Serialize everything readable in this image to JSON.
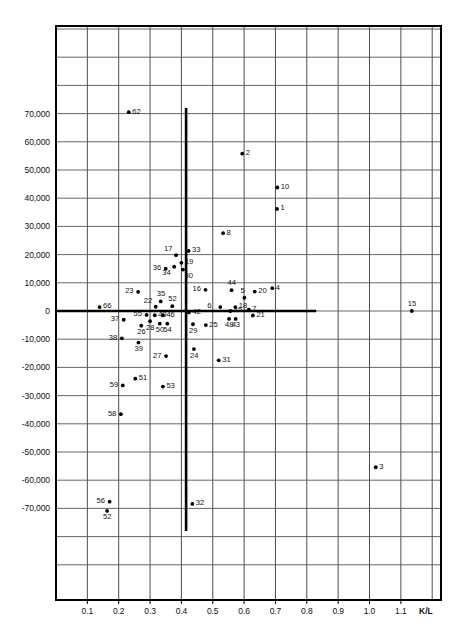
{
  "chart_data": {
    "type": "scatter",
    "title": "",
    "xlabel": "K/L",
    "ylabel": "",
    "xlim": [
      0.0,
      1.2
    ],
    "ylim": [
      -90000,
      100000
    ],
    "grid": true,
    "legend": false,
    "xticks": [
      {
        "value": 0.1,
        "label": "0.1"
      },
      {
        "value": 0.2,
        "label": "0.2"
      },
      {
        "value": 0.3,
        "label": "0.3"
      },
      {
        "value": 0.4,
        "label": "0.4"
      },
      {
        "value": 0.5,
        "label": "0.5"
      },
      {
        "value": 0.6,
        "label": "0.6"
      },
      {
        "value": 0.7,
        "label": "0.7"
      },
      {
        "value": 0.8,
        "label": "0.8"
      },
      {
        "value": 0.9,
        "label": "0.9"
      },
      {
        "value": 1.0,
        "label": "1.0"
      },
      {
        "value": 1.1,
        "label": "1.1"
      }
    ],
    "yticks": [
      {
        "value": 70000,
        "label": "70,000"
      },
      {
        "value": 60000,
        "label": "60,000"
      },
      {
        "value": 50000,
        "label": "50,000"
      },
      {
        "value": 40000,
        "label": "40,000"
      },
      {
        "value": 30000,
        "label": "30,000"
      },
      {
        "value": 20000,
        "label": "20,000"
      },
      {
        "value": 10000,
        "label": "10,000"
      },
      {
        "value": 0,
        "label": "0"
      },
      {
        "value": -10000,
        "label": "-10,000"
      },
      {
        "value": -20000,
        "label": "-20,000"
      },
      {
        "value": -30000,
        "label": "-30,000"
      },
      {
        "value": -40000,
        "label": "-40,000"
      },
      {
        "value": -50000,
        "label": "-50,000"
      },
      {
        "value": -60000,
        "label": "-60,000"
      },
      {
        "value": -70000,
        "label": "-70,000"
      }
    ],
    "reference_lines": {
      "vertical": {
        "x": 0.415,
        "y_from": -78000,
        "y_to": 72000,
        "color": "#000000"
      },
      "horizontal": {
        "y": 0,
        "x_from": 0.0,
        "x_to": 0.83,
        "color": "#000000"
      }
    },
    "points": [
      {
        "id": "62",
        "x": 0.232,
        "y": 70500,
        "label_side": "right"
      },
      {
        "id": "2",
        "x": 0.594,
        "y": 55800,
        "label_side": "right"
      },
      {
        "id": "10",
        "x": 0.706,
        "y": 43800,
        "label_side": "right"
      },
      {
        "id": "1",
        "x": 0.705,
        "y": 36200,
        "label_side": "right"
      },
      {
        "id": "8",
        "x": 0.533,
        "y": 27600,
        "label_side": "right"
      },
      {
        "id": "33",
        "x": 0.423,
        "y": 21300,
        "label_side": "right"
      },
      {
        "id": "17",
        "x": 0.383,
        "y": 19800,
        "label_side": "above-left"
      },
      {
        "id": "19",
        "x": 0.4,
        "y": 17100,
        "label_side": "right"
      },
      {
        "id": "36",
        "x": 0.35,
        "y": 15000,
        "label_side": "left"
      },
      {
        "id": "34",
        "x": 0.377,
        "y": 15700,
        "label_side": "below-left"
      },
      {
        "id": "30",
        "x": 0.405,
        "y": 14700,
        "label_side": "below-right"
      },
      {
        "id": "23",
        "x": 0.262,
        "y": 6800,
        "label_side": "left"
      },
      {
        "id": "35",
        "x": 0.334,
        "y": 3400,
        "label_side": "above"
      },
      {
        "id": "16",
        "x": 0.477,
        "y": 7500,
        "label_side": "left"
      },
      {
        "id": "44",
        "x": 0.56,
        "y": 7400,
        "label_side": "above"
      },
      {
        "id": "5",
        "x": 0.601,
        "y": 4700,
        "label_side": "above"
      },
      {
        "id": "20",
        "x": 0.634,
        "y": 6900,
        "label_side": "right"
      },
      {
        "id": "4",
        "x": 0.69,
        "y": 8100,
        "label_side": "right"
      },
      {
        "id": "66",
        "x": 0.139,
        "y": 1400,
        "label_side": "right"
      },
      {
        "id": "22",
        "x": 0.318,
        "y": 1500,
        "label_side": "above-left"
      },
      {
        "id": "52",
        "x": 0.371,
        "y": 1700,
        "label_side": "above"
      },
      {
        "id": "6",
        "x": 0.524,
        "y": 1400,
        "label_side": "left"
      },
      {
        "id": "18",
        "x": 0.572,
        "y": 1400,
        "label_side": "right"
      },
      {
        "id": "45",
        "x": 0.556,
        "y": 0,
        "label_side": "right"
      },
      {
        "id": "7",
        "x": 0.615,
        "y": 500,
        "label_side": "right"
      },
      {
        "id": "15",
        "x": 1.135,
        "y": 0,
        "label_side": "above"
      },
      {
        "id": "42",
        "x": 0.424,
        "y": -500,
        "label_side": "right"
      },
      {
        "id": "55",
        "x": 0.289,
        "y": -1400,
        "label_side": "left"
      },
      {
        "id": "49",
        "x": 0.315,
        "y": -1500,
        "label_side": "right"
      },
      {
        "id": "46",
        "x": 0.341,
        "y": -1500,
        "label_side": "right"
      },
      {
        "id": "21",
        "x": 0.628,
        "y": -1600,
        "label_side": "right"
      },
      {
        "id": "43",
        "x": 0.573,
        "y": -2800,
        "label_side": "below"
      },
      {
        "id": "48",
        "x": 0.552,
        "y": -2800,
        "label_side": "below"
      },
      {
        "id": "37",
        "x": 0.216,
        "y": -3100,
        "label_side": "left"
      },
      {
        "id": "28",
        "x": 0.3,
        "y": -3600,
        "label_side": "below"
      },
      {
        "id": "50",
        "x": 0.331,
        "y": -4500,
        "label_side": "below"
      },
      {
        "id": "54",
        "x": 0.355,
        "y": -4500,
        "label_side": "below"
      },
      {
        "id": "29",
        "x": 0.437,
        "y": -4700,
        "label_side": "below"
      },
      {
        "id": "25",
        "x": 0.478,
        "y": -5000,
        "label_side": "right"
      },
      {
        "id": "26",
        "x": 0.272,
        "y": -5200,
        "label_side": "below"
      },
      {
        "id": "38",
        "x": 0.21,
        "y": -9700,
        "label_side": "left"
      },
      {
        "id": "39",
        "x": 0.263,
        "y": -11200,
        "label_side": "below"
      },
      {
        "id": "24",
        "x": 0.44,
        "y": -13500,
        "label_side": "below"
      },
      {
        "id": "27",
        "x": 0.351,
        "y": -16000,
        "label_side": "left"
      },
      {
        "id": "31",
        "x": 0.519,
        "y": -17500,
        "label_side": "right"
      },
      {
        "id": "51",
        "x": 0.253,
        "y": -24000,
        "label_side": "right"
      },
      {
        "id": "59",
        "x": 0.213,
        "y": -26400,
        "label_side": "left"
      },
      {
        "id": "53",
        "x": 0.341,
        "y": -26800,
        "label_side": "right"
      },
      {
        "id": "58",
        "x": 0.207,
        "y": -36600,
        "label_side": "left"
      },
      {
        "id": "3",
        "x": 1.02,
        "y": -55400,
        "label_side": "right"
      },
      {
        "id": "56",
        "x": 0.171,
        "y": -67600,
        "label_side": "left"
      },
      {
        "id": "32",
        "x": 0.435,
        "y": -68400,
        "label_side": "right"
      },
      {
        "id": "52b",
        "x": 0.163,
        "y": -70900,
        "display_id": "52",
        "label_side": "below"
      }
    ]
  },
  "axes": {
    "x_axis_title": "K/L"
  },
  "caption": {
    "text": ""
  }
}
